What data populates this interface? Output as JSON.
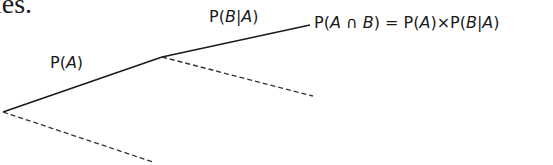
{
  "clipped_text": "ies.",
  "tree": {
    "branches": [
      {
        "id": "root-to-A",
        "label": "P(A)",
        "style": "solid"
      },
      {
        "id": "root-to-notA",
        "label": "",
        "style": "dashed"
      },
      {
        "id": "A-to-B",
        "label": "P(B|A)",
        "style": "solid"
      },
      {
        "id": "A-to-notB",
        "label": "",
        "style": "dashed"
      }
    ],
    "result_label": "P(A ∩ B) = P(A)×P(B|A)"
  },
  "colors": {
    "line": "#1a1a1a",
    "dashed": "#333333",
    "text": "#1a1a1a"
  }
}
